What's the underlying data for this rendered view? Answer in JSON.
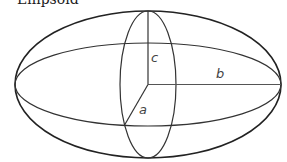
{
  "diagram": {
    "title": "Ellipsoid",
    "stroke_color": "#222222",
    "labels": {
      "a": "a",
      "b": "b",
      "c": "c"
    },
    "center": {
      "x": 148,
      "y": 84.5
    },
    "outer_ellipse": {
      "rx": 133,
      "ry": 73.5
    },
    "equatorial_ellipse": {
      "rx": 133,
      "ry": 41.5
    },
    "meridian_ellipse": {
      "rx": 28,
      "ry": 73.5
    },
    "semi_axes": [
      {
        "name": "a",
        "from": [
          148,
          84.5
        ],
        "to": [
          124,
          126
        ]
      },
      {
        "name": "b",
        "from": [
          148,
          84.5
        ],
        "to": [
          281,
          84.5
        ]
      },
      {
        "name": "c",
        "from": [
          148,
          84.5
        ],
        "to": [
          148,
          11
        ]
      }
    ]
  }
}
